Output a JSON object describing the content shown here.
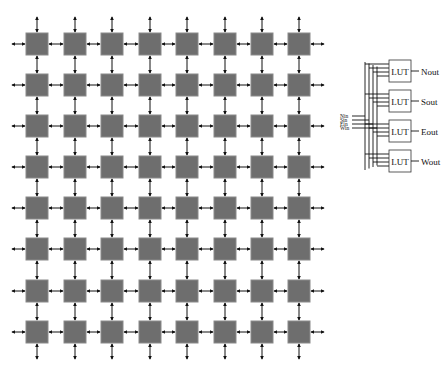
{
  "grid": {
    "rows": 8,
    "cols": 8,
    "col_x": [
      26,
      64,
      101,
      139,
      176,
      214,
      251,
      288
    ],
    "row_y": [
      33,
      74,
      115,
      156,
      197,
      238,
      280,
      321
    ],
    "cell_size": 22,
    "cell_color": "#6e6e6e",
    "cell_border": "#8a8a8a",
    "arrow_color": "#111111"
  },
  "lut_detail": {
    "inputs": [
      "Nin",
      "Sin",
      "Ein",
      "Win"
    ],
    "lut_label": "LUT",
    "outputs": [
      "Nout",
      "Sout",
      "Eout",
      "Wout"
    ],
    "box_x": 389,
    "box_y": [
      60,
      90,
      120,
      150
    ],
    "box_w": 22,
    "box_h": 22
  }
}
